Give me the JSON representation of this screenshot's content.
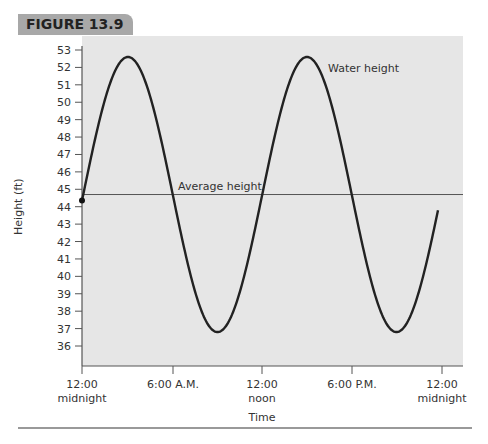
{
  "figure_label": "FIGURE 13.9",
  "chart_data": {
    "type": "line",
    "title": "",
    "xlabel": "Time",
    "ylabel": "Height (ft)",
    "ylim": [
      35,
      53
    ],
    "yticks": [
      36,
      37,
      38,
      39,
      40,
      41,
      42,
      43,
      44,
      45,
      46,
      47,
      48,
      49,
      50,
      51,
      52,
      53
    ],
    "xticks": [
      {
        "hour": 0,
        "line1": "12:00",
        "line2": "midnight"
      },
      {
        "hour": 6,
        "line1": "6:00 A.M.",
        "line2": ""
      },
      {
        "hour": 12,
        "line1": "12:00",
        "line2": "noon"
      },
      {
        "hour": 18,
        "line1": "6:00 P.M.",
        "line2": ""
      },
      {
        "hour": 24,
        "line1": "12:00",
        "line2": "midnight"
      }
    ],
    "series": [
      {
        "name": "Water height",
        "model": "44.7 + 7.9*sin(2*pi*(t - 0.27)/12.4)",
        "start": {
          "hour": 0,
          "value": 43.6
        },
        "peaks": [
          {
            "hour": 3.3,
            "value": 52.6
          },
          {
            "hour": 15.7,
            "value": 52.6
          }
        ],
        "troughs": [
          {
            "hour": 9.5,
            "value": 36.8
          },
          {
            "hour": 21.9,
            "value": 36.8
          }
        ],
        "end": {
          "hour": 24.9,
          "value": 44.6
        }
      },
      {
        "name": "Average height",
        "value": 44.7
      }
    ],
    "annotations": [
      "Water height",
      "Average height"
    ],
    "grid": false
  }
}
